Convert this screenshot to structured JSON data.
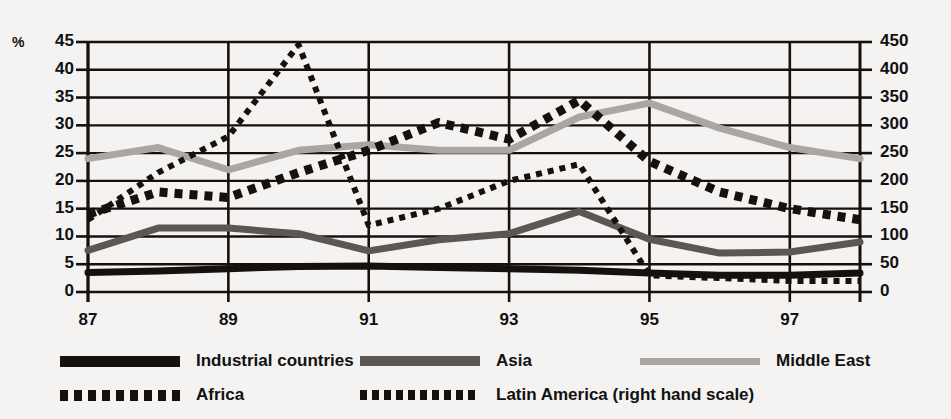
{
  "chart_data": {
    "type": "line",
    "title": "",
    "xlabel": "",
    "ylabel": "%",
    "x": [
      87,
      88,
      89,
      90,
      91,
      92,
      93,
      94,
      95,
      96,
      97,
      98
    ],
    "xtick_labels": [
      "87",
      "89",
      "91",
      "93",
      "95",
      "97"
    ],
    "xticks": [
      87,
      89,
      91,
      93,
      95,
      97
    ],
    "left_axis": {
      "label": "%",
      "ylim": [
        0,
        45
      ],
      "ticks": [
        0,
        5,
        10,
        15,
        20,
        25,
        30,
        35,
        40,
        45
      ],
      "tick_labels": [
        "0",
        "5",
        "10",
        "15",
        "20",
        "25",
        "30",
        "35",
        "40",
        "45"
      ]
    },
    "right_axis": {
      "label": "",
      "ylim": [
        0,
        450
      ],
      "ticks": [
        0,
        50,
        100,
        150,
        200,
        250,
        300,
        350,
        400,
        450
      ],
      "tick_labels": [
        "0",
        "50",
        "100",
        "150",
        "200",
        "250",
        "300",
        "350",
        "400",
        "450"
      ]
    },
    "grid": true,
    "legend_position": "below",
    "series": [
      {
        "name": "Industrial countries",
        "axis": "left",
        "style": "solid",
        "color": "#15110f",
        "width": 7,
        "values": [
          3.5,
          3.8,
          4.2,
          4.6,
          4.7,
          4.4,
          4.2,
          3.9,
          3.4,
          3.0,
          3.0,
          3.4
        ]
      },
      {
        "name": "Asia",
        "axis": "left",
        "style": "solid",
        "color": "#5b5755",
        "width": 7,
        "values": [
          7.5,
          11.5,
          11.5,
          10.5,
          7.4,
          9.4,
          10.5,
          14.5,
          9.5,
          7.0,
          7.2,
          9.0
        ]
      },
      {
        "name": "Middle East",
        "axis": "left",
        "style": "solid",
        "color": "#a9a6a3",
        "width": 7,
        "values": [
          24.0,
          26.0,
          22.0,
          25.5,
          26.5,
          25.5,
          25.5,
          31.5,
          34.0,
          29.5,
          26.0,
          24.0
        ]
      },
      {
        "name": "Africa",
        "axis": "left",
        "style": "dotted",
        "color": "#15110f",
        "width": 9,
        "values": [
          14.0,
          18.0,
          17.0,
          21.5,
          25.5,
          30.5,
          27.5,
          34.5,
          23.5,
          18.0,
          15.0,
          13.0
        ]
      },
      {
        "name": "Latin America (right hand scale)",
        "axis": "right",
        "style": "dotted",
        "color": "#15110f",
        "width": 6,
        "values": [
          130,
          215,
          280,
          445,
          120,
          150,
          200,
          230,
          30,
          25,
          20,
          20
        ]
      }
    ]
  },
  "legend": {
    "rows": [
      [
        {
          "label": "Industrial countries",
          "series": "Industrial countries",
          "bold_suffix": ""
        },
        {
          "label": "Asia",
          "series": "Asia",
          "bold_suffix": ""
        },
        {
          "label": "Middle East",
          "series": "Middle East",
          "bold_suffix": ""
        }
      ],
      [
        {
          "label": "Africa",
          "series": "Africa",
          "bold_suffix": ""
        },
        {
          "label": "Latin America ",
          "series": "Latin America (right hand scale)",
          "bold_suffix": "(right hand scale)"
        }
      ]
    ]
  }
}
